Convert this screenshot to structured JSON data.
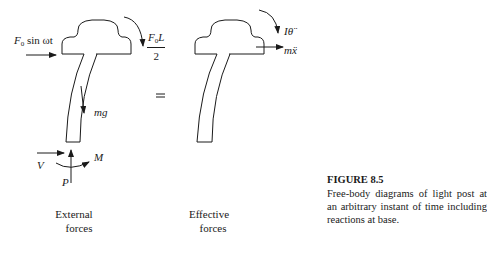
{
  "diagram": {
    "left_panel": {
      "applied_force_label": "F",
      "applied_force_sub": "0",
      "applied_force_rest": " sin ωt",
      "moment_fraction_num": "F",
      "moment_fraction_num_sub": "0",
      "moment_fraction_num_rest": "L",
      "moment_fraction_den": "2",
      "weight_label": "mg",
      "shear_label": "V",
      "axial_label": "P",
      "base_moment_label": "M",
      "caption_line1": "External",
      "caption_line2": "forces"
    },
    "equals_sign": "=",
    "right_panel": {
      "inertia_moment_label": "Iθ̈",
      "inertia_force_label": "mẍ",
      "caption_line1": "Effective",
      "caption_line2": "forces"
    },
    "figure_caption": {
      "number": "FIGURE 8.5",
      "text": "Free-body diagrams of light post at an arbitrary instant of time including reactions at base."
    },
    "colors": {
      "stroke": "#1a1a1a",
      "background": "#ffffff"
    }
  }
}
